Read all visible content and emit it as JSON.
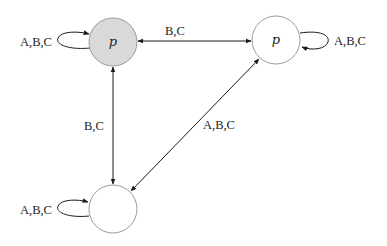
{
  "diagram": {
    "type": "state-transition-graph",
    "nodes": [
      {
        "id": "n1",
        "label": "p",
        "fill": "#d9d9d9"
      },
      {
        "id": "n2",
        "label": "p",
        "fill": "#ffffff"
      },
      {
        "id": "n3",
        "label": "",
        "fill": "#ffffff"
      }
    ],
    "self_loops": [
      {
        "node": "n1",
        "label": "A,B,C"
      },
      {
        "node": "n2",
        "label": "A,B,C"
      },
      {
        "node": "n3",
        "label": "A,B,C"
      }
    ],
    "edges": [
      {
        "from": "n1",
        "to": "n2",
        "label": "B,C",
        "bidirectional": true
      },
      {
        "from": "n1",
        "to": "n3",
        "label": "B,C",
        "bidirectional": true
      },
      {
        "from": "n2",
        "to": "n3",
        "label": "A,B,C",
        "bidirectional": true
      }
    ]
  }
}
